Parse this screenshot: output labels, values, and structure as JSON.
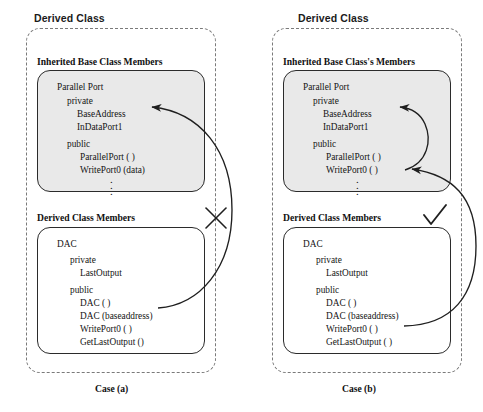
{
  "figure": {
    "type": "uml-like class inheritance diagram",
    "background": "#ffffff",
    "line_color": "#2b2b2b",
    "shaded_fill": "#e9e9e9",
    "dashed_color": "#7a7a7a"
  },
  "cases": [
    {
      "id": "case-a",
      "case_label": "Case (a)",
      "derived_class_title": "Derived Class",
      "inherited_section_title": "Inherited Base Class Members",
      "derived_section_title": "Derived Class Members",
      "verdict_mark": "x-mark",
      "base_box": {
        "class_name": "Parallel Port",
        "groups": [
          {
            "access": "private",
            "members": [
              "BaseAddress",
              "InDataPort1"
            ]
          },
          {
            "access": "public",
            "members": [
              "ParallelPort ( )",
              "WritePort0 (data)"
            ]
          }
        ],
        "ellipsis": "vertical-dots"
      },
      "derived_box": {
        "class_name": "DAC",
        "groups": [
          {
            "access": "private",
            "members": [
              "LastOutput"
            ]
          },
          {
            "access": "public",
            "members": [
              "DAC ( )",
              "DAC (baseaddress)",
              "WritePort0 ( )",
              "GetLastOutput ()"
            ]
          }
        ]
      },
      "arrows": [
        {
          "name": "writeport0-to-baseaddress",
          "from": "WritePort0 ( )",
          "to": "BaseAddress",
          "style": "curved, crosses outside box"
        }
      ]
    },
    {
      "id": "case-b",
      "case_label": "Case (b)",
      "derived_class_title": "Derived Class",
      "inherited_section_title": "Inherited Base Class's Members",
      "derived_section_title": "Derived Class Members",
      "verdict_mark": "check-mark",
      "base_box": {
        "class_name": "Parallel Port",
        "groups": [
          {
            "access": "private",
            "members": [
              "BaseAddress",
              "InDataPort1"
            ]
          },
          {
            "access": "public",
            "members": [
              "ParallelPort ( )",
              "WritePort0 ( )"
            ]
          }
        ],
        "ellipsis": "vertical-dots"
      },
      "derived_box": {
        "class_name": "DAC",
        "groups": [
          {
            "access": "private",
            "members": [
              "LastOutput"
            ]
          },
          {
            "access": "public",
            "members": [
              "DAC ( )",
              "DAC (baseaddress)",
              "WritePort0 ( )",
              "GetLastOutput ( )"
            ]
          }
        ]
      },
      "arrows": [
        {
          "name": "derived-writeport0-to-base-writeport0",
          "from": "WritePort0 ( )",
          "to": "WritePort0 ( )",
          "style": "long curve"
        },
        {
          "name": "base-writeport0-to-baseaddress",
          "from": "WritePort0 ( )",
          "to": "BaseAddress",
          "style": "short curve"
        }
      ]
    }
  ]
}
